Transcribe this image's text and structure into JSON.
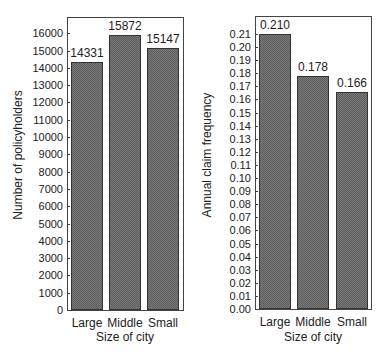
{
  "chart_data": [
    {
      "type": "bar",
      "title": "",
      "xlabel": "Size of city",
      "ylabel": "Number of policyholders",
      "categories": [
        "Large",
        "Middle",
        "Small"
      ],
      "values": [
        14331,
        15872,
        15147
      ],
      "value_labels": [
        "14331",
        "15872",
        "15147"
      ],
      "ylim": [
        0,
        16900
      ],
      "yticks": [
        0,
        1000,
        2000,
        3000,
        4000,
        5000,
        6000,
        7000,
        8000,
        9000,
        10000,
        11000,
        12000,
        13000,
        14000,
        15000,
        16000
      ],
      "grid": false,
      "legend": null
    },
    {
      "type": "bar",
      "title": "",
      "xlabel": "Size of city",
      "ylabel": "Annual claim frequency",
      "categories": [
        "Large",
        "Middle",
        "Small"
      ],
      "values": [
        0.21,
        0.178,
        0.166
      ],
      "value_labels": [
        "0.210",
        "0.178",
        "0.166"
      ],
      "ylim": [
        0,
        0.223
      ],
      "yticks": [
        "0.00",
        "0.01",
        "0.02",
        "0.03",
        "0.04",
        "0.05",
        "0.06",
        "0.07",
        "0.08",
        "0.09",
        "0.10",
        "0.11",
        "0.12",
        "0.13",
        "0.14",
        "0.15",
        "0.16",
        "0.17",
        "0.18",
        "0.19",
        "0.20",
        "0.21"
      ],
      "grid": false,
      "legend": null
    }
  ]
}
